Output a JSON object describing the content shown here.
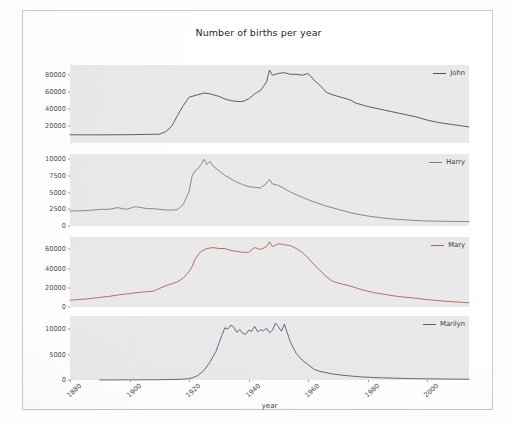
{
  "chart_data": [
    {
      "type": "line",
      "title": "Number of births per year",
      "xlabel": "year",
      "ylabel": "",
      "grid": false,
      "legend_position": "top-right",
      "xlim": [
        1880,
        2014
      ],
      "xticks": [
        1880,
        1900,
        1920,
        1940,
        1960,
        1980,
        2000
      ],
      "panel": 1,
      "series": [
        {
          "name": "John",
          "color": "#4a4e69",
          "ylim": [
            0,
            92000
          ],
          "yticks": [
            20000,
            40000,
            60000,
            80000
          ],
          "x": [
            1880,
            1885,
            1890,
            1895,
            1900,
            1905,
            1910,
            1912,
            1914,
            1915,
            1916,
            1918,
            1920,
            1922,
            1924,
            1925,
            1927,
            1929,
            1930,
            1932,
            1934,
            1936,
            1938,
            1940,
            1942,
            1944,
            1946,
            1947,
            1948,
            1950,
            1952,
            1954,
            1956,
            1958,
            1960,
            1962,
            1964,
            1966,
            1968,
            1970,
            1972,
            1974,
            1976,
            1980,
            1984,
            1988,
            1992,
            1996,
            2000,
            2004,
            2008,
            2012,
            2014
          ],
          "y": [
            9700,
            9600,
            9600,
            9700,
            9800,
            10100,
            10400,
            13000,
            19000,
            25000,
            32000,
            44000,
            54000,
            56000,
            58000,
            59000,
            58000,
            56000,
            55000,
            52000,
            50000,
            49000,
            49000,
            52000,
            58000,
            62000,
            72000,
            86000,
            80000,
            82000,
            83000,
            81000,
            81000,
            80000,
            82000,
            74000,
            68000,
            60000,
            57000,
            55000,
            53000,
            51000,
            47000,
            43000,
            40000,
            37000,
            34000,
            31000,
            27000,
            24000,
            22000,
            20000,
            19000
          ]
        }
      ]
    },
    {
      "type": "line",
      "panel": 2,
      "series": [
        {
          "name": "Harry",
          "color": "#6d8b63",
          "ylim": [
            0,
            10800
          ],
          "yticks": [
            0,
            2500,
            5000,
            7500,
            10000
          ],
          "x": [
            1880,
            1885,
            1888,
            1890,
            1893,
            1896,
            1899,
            1902,
            1904,
            1906,
            1908,
            1910,
            1912,
            1914,
            1916,
            1918,
            1920,
            1921,
            1922,
            1923,
            1924,
            1925,
            1926,
            1927,
            1928,
            1930,
            1932,
            1935,
            1938,
            1940,
            1942,
            1944,
            1946,
            1947,
            1948,
            1950,
            1954,
            1958,
            1962,
            1966,
            1970,
            1975,
            1980,
            1985,
            1990,
            1995,
            2000,
            2006,
            2012,
            2014
          ],
          "y": [
            2250,
            2300,
            2400,
            2500,
            2500,
            2750,
            2500,
            2900,
            2750,
            2600,
            2600,
            2500,
            2400,
            2400,
            2450,
            3200,
            5200,
            7500,
            8300,
            8600,
            9200,
            10000,
            9200,
            9700,
            9000,
            8300,
            7600,
            6800,
            6200,
            5900,
            5800,
            5700,
            6400,
            7000,
            6300,
            6100,
            5100,
            4300,
            3600,
            3000,
            2500,
            1900,
            1500,
            1200,
            1000,
            850,
            750,
            700,
            680,
            670
          ]
        }
      ]
    },
    {
      "type": "line",
      "panel": 3,
      "series": [
        {
          "name": "Mary",
          "color": "#b0634d",
          "ylim": [
            0,
            73000
          ],
          "yticks": [
            0,
            20000,
            40000,
            60000
          ],
          "x": [
            1880,
            1885,
            1890,
            1893,
            1896,
            1900,
            1904,
            1908,
            1912,
            1914,
            1916,
            1918,
            1920,
            1921,
            1922,
            1924,
            1926,
            1928,
            1930,
            1932,
            1934,
            1936,
            1938,
            1940,
            1942,
            1944,
            1946,
            1947,
            1948,
            1950,
            1952,
            1954,
            1956,
            1958,
            1960,
            1962,
            1964,
            1966,
            1968,
            1970,
            1974,
            1978,
            1982,
            1986,
            1990,
            1995,
            2000,
            2006,
            2012,
            2014
          ],
          "y": [
            7100,
            8200,
            10000,
            11000,
            12500,
            14000,
            15500,
            16500,
            22000,
            24000,
            26000,
            30000,
            37000,
            42000,
            50000,
            58000,
            61000,
            62000,
            61000,
            61000,
            59000,
            58000,
            57000,
            57000,
            62000,
            60000,
            63000,
            68000,
            63000,
            66000,
            65000,
            64000,
            61000,
            57000,
            51000,
            44000,
            38000,
            32000,
            27000,
            25000,
            22000,
            18000,
            15000,
            13000,
            11000,
            9500,
            7700,
            6000,
            4800,
            4400
          ]
        }
      ]
    },
    {
      "type": "line",
      "panel": 4,
      "series": [
        {
          "name": "Marilyn",
          "color": "#55597a",
          "ylim": [
            0,
            12600
          ],
          "yticks": [
            0,
            5000,
            10000
          ],
          "x": [
            1890,
            1895,
            1900,
            1905,
            1910,
            1913,
            1915,
            1917,
            1919,
            1921,
            1923,
            1925,
            1927,
            1928,
            1929,
            1930,
            1931,
            1932,
            1933,
            1934,
            1935,
            1936,
            1937,
            1938,
            1939,
            1940,
            1941,
            1942,
            1943,
            1944,
            1945,
            1946,
            1947,
            1948,
            1949,
            1950,
            1951,
            1952,
            1954,
            1956,
            1958,
            1960,
            1962,
            1964,
            1968,
            1972,
            1978,
            1985,
            1992,
            2000,
            2008,
            2014
          ],
          "y": [
            15,
            20,
            25,
            35,
            60,
            90,
            110,
            140,
            190,
            400,
            900,
            1900,
            3500,
            4600,
            5600,
            7200,
            8800,
            10300,
            10000,
            10800,
            10400,
            9400,
            9900,
            9200,
            9000,
            9800,
            9600,
            10600,
            9500,
            9900,
            9700,
            10200,
            9300,
            9800,
            11200,
            10500,
            9600,
            11000,
            7500,
            5200,
            3900,
            3000,
            2100,
            1700,
            1200,
            900,
            600,
            420,
            300,
            230,
            180,
            150
          ]
        }
      ]
    }
  ],
  "axes": {
    "xlabel": "year",
    "xticks": [
      "1880",
      "1900",
      "1920",
      "1940",
      "1960",
      "1980",
      "2000"
    ]
  },
  "title": "Number of births per year",
  "legend_labels": [
    "John",
    "Harry",
    "Mary",
    "Marilyn"
  ],
  "colors": {
    "john": "#4a4e69",
    "harry": "#6d8b63",
    "mary": "#b0634d",
    "marilyn": "#55597a",
    "plot_background": "#e9e9e9",
    "page_background": "#ffffff",
    "frame": "#c9c9c9",
    "text": "#3a3a3a"
  }
}
